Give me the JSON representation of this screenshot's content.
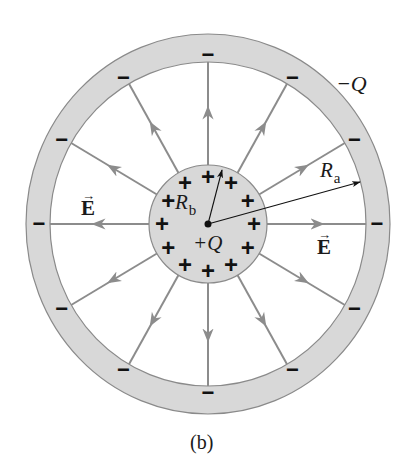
{
  "figure": {
    "caption": "(b)",
    "center": [
      208,
      224
    ],
    "outer_shell": {
      "outer_rx": 182,
      "outer_ry": 190,
      "inner_rx": 158,
      "inner_ry": 162,
      "fill": "#d8d8d8",
      "stroke": "#8a8a8a",
      "charge_label": "−Q",
      "charge_sign": "−",
      "charge_count": 12
    },
    "inner_sphere": {
      "radius": 59,
      "fill": "#d8d8d8",
      "stroke": "#8a8a8a",
      "charge_label": "+Q",
      "charge_sign": "+",
      "charge_count": 12
    },
    "field_lines": {
      "count": 12,
      "color": "#8c8c8c",
      "direction": "outward",
      "label": "E"
    },
    "radius_labels": {
      "inner": {
        "symbol": "R",
        "subscript": "b"
      },
      "outer": {
        "symbol": "R",
        "subscript": "a"
      }
    },
    "field_label_positions": [
      "left",
      "right"
    ]
  }
}
